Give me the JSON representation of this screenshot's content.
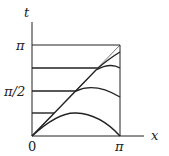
{
  "diagram": {
    "type": "characteristic-curves",
    "axes": {
      "x_label": "x",
      "t_label": "t",
      "origin_label": "0",
      "x_ticks": [
        {
          "value": "π",
          "label": "π"
        }
      ],
      "t_ticks": [
        {
          "value": "π",
          "label": "π"
        },
        {
          "value": "π/2",
          "label": "π/2"
        }
      ]
    },
    "domain": {
      "x": [
        0,
        "π"
      ],
      "t": [
        0,
        "π"
      ]
    },
    "curves": [
      {
        "name": "diagonal",
        "description": "t = x from (0,0) to (π,π)"
      },
      {
        "name": "curve-t-pi",
        "description": "horizontal at t=π"
      },
      {
        "name": "curve-t-3pi4",
        "description": "horizontal at t=3π/4 then joins diagonal and bends"
      },
      {
        "name": "curve-t-pi2",
        "description": "horizontal at t=π/2 then joins diagonal, arches down"
      },
      {
        "name": "curve-t-pi4",
        "description": "horizontal at t=π/4 then joins diagonal, arches down"
      },
      {
        "name": "curve-t-0",
        "description": "arch from origin to (π,0)"
      }
    ],
    "colors": {
      "line": "#222222",
      "diagonal": "#555555",
      "background": "#ffffff"
    }
  }
}
